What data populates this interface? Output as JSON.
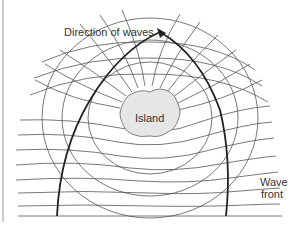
{
  "diagram": {
    "labels": {
      "direction": "Direction of waves",
      "island": "Island",
      "wave_line1": "Wave",
      "wave_line2": "front"
    },
    "colors": {
      "line": "#4a4a4a",
      "thick_line": "#222222",
      "island_fill": "#e6e6e6",
      "border": "#999999",
      "text": "#333333"
    }
  }
}
